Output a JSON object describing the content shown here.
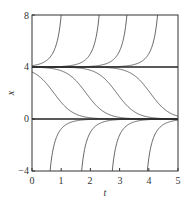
{
  "chart_data": {
    "type": "line",
    "title": "",
    "xlabel": "t",
    "ylabel": "x",
    "xlim": [
      0,
      5
    ],
    "ylim": [
      -4,
      8
    ],
    "xticks": [
      0,
      1,
      2,
      3,
      4,
      5
    ],
    "yticks": [
      -4,
      0,
      4,
      8
    ],
    "xtick_labels": [
      "0",
      "1",
      "2",
      "3",
      "4",
      "5"
    ],
    "ytick_labels": [
      "−4",
      "0",
      "4",
      "8"
    ],
    "grid": false,
    "legend": null,
    "equilibria": [
      {
        "name": "x = 4",
        "value": 4
      },
      {
        "name": "x = 0",
        "value": 0
      }
    ],
    "k": 3.0,
    "series": [
      {
        "name": "blowup-1",
        "kind": "above",
        "reaches_top_at_t": 1.0
      },
      {
        "name": "blowup-2",
        "kind": "above",
        "reaches_top_at_t": 2.3
      },
      {
        "name": "blowup-3",
        "kind": "above",
        "reaches_top_at_t": 3.25
      },
      {
        "name": "blowup-4",
        "kind": "above",
        "reaches_top_at_t": 4.3
      },
      {
        "name": "transition-1",
        "kind": "middle",
        "midpoint_t": 0.75
      },
      {
        "name": "transition-2",
        "kind": "middle",
        "midpoint_t": 1.85
      },
      {
        "name": "transition-3",
        "kind": "middle",
        "midpoint_t": 2.9
      },
      {
        "name": "transition-4",
        "kind": "middle",
        "midpoint_t": 4.05
      },
      {
        "name": "approach-1",
        "kind": "below",
        "starts_bottom_at_t": 0.62
      },
      {
        "name": "approach-2",
        "kind": "below",
        "starts_bottom_at_t": 1.7
      },
      {
        "name": "approach-3",
        "kind": "below",
        "starts_bottom_at_t": 2.75
      },
      {
        "name": "approach-4",
        "kind": "below",
        "starts_bottom_at_t": 3.95
      }
    ],
    "colors": {
      "curve": "#555555",
      "equilibrium": "#222222",
      "frame": "#333333"
    }
  },
  "labels": {
    "xlabel": "t",
    "ylabel": "x",
    "xticks": [
      "0",
      "1",
      "2",
      "3",
      "4",
      "5"
    ],
    "yticks": [
      "−4",
      "0",
      "4",
      "8"
    ]
  }
}
